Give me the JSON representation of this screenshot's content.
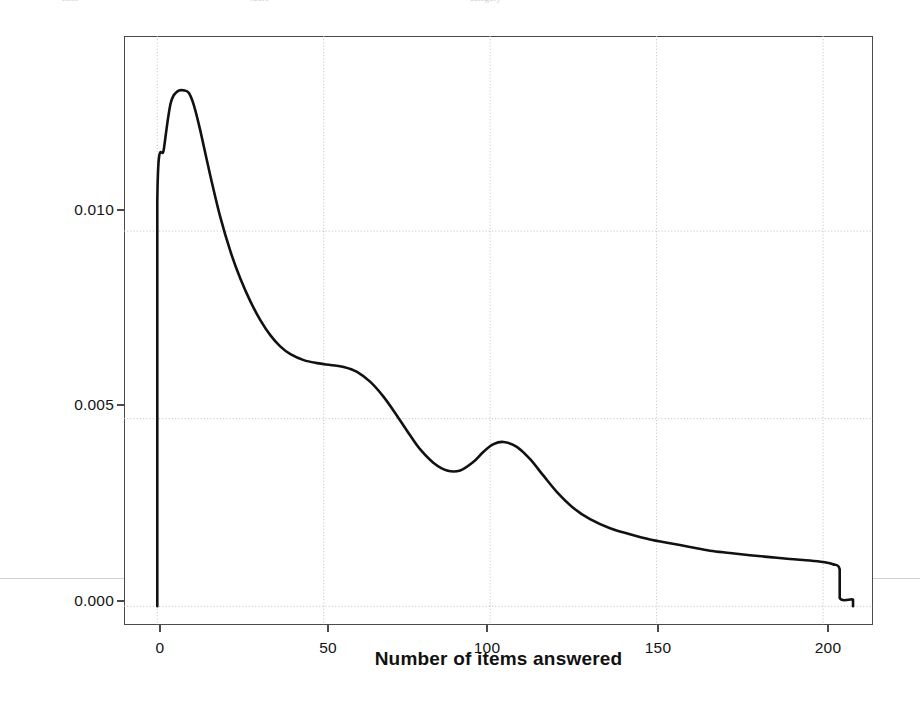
{
  "page": {
    "top_artifact_fragments": [
      "item",
      "score",
      "category"
    ],
    "background_color": "#ffffff"
  },
  "chart_data": {
    "type": "line",
    "title": "",
    "subtitle": "",
    "xlabel": "Number of items answered",
    "ylabel": "Probability Density",
    "xlim": [
      -10,
      215
    ],
    "ylim": [
      -0.0005,
      0.0152
    ],
    "xticks": [
      0,
      50,
      100,
      150,
      200
    ],
    "xticklabels": [
      "0",
      "50",
      "100",
      "150",
      "200"
    ],
    "yticks": [
      0.0,
      0.005,
      0.01
    ],
    "yticklabels": [
      "0.000",
      "0.005",
      "0.010"
    ],
    "grid": true,
    "grid_style": "dotted",
    "legend": "none",
    "line_color": "#111111",
    "line_width": 2.6,
    "series": [
      {
        "name": "Probability density of number of items answered",
        "x": [
          0,
          0,
          2,
          4,
          6,
          8,
          9.5,
          11,
          13,
          16,
          19,
          22,
          25,
          28,
          31,
          34,
          37,
          40,
          44,
          48,
          52,
          56,
          60,
          64,
          68,
          72,
          76,
          79,
          83,
          87,
          91,
          95,
          98,
          101,
          104,
          108,
          112,
          116,
          120,
          125,
          130,
          136,
          142,
          148,
          154,
          160,
          166,
          172,
          178,
          184,
          190,
          196,
          200,
          203,
          205,
          205,
          209,
          209
        ],
        "y": [
          0.0,
          0.0108,
          0.0122,
          0.0134,
          0.01372,
          0.01375,
          0.01368,
          0.01335,
          0.01265,
          0.01145,
          0.01035,
          0.00945,
          0.00872,
          0.00812,
          0.00762,
          0.00722,
          0.00692,
          0.00672,
          0.00656,
          0.00648,
          0.00643,
          0.00638,
          0.00625,
          0.00598,
          0.00558,
          0.00508,
          0.00455,
          0.00418,
          0.00382,
          0.00362,
          0.00362,
          0.00385,
          0.00412,
          0.00432,
          0.00438,
          0.00425,
          0.00392,
          0.00348,
          0.00305,
          0.00262,
          0.00232,
          0.00208,
          0.00192,
          0.00178,
          0.00168,
          0.00158,
          0.00148,
          0.00142,
          0.00136,
          0.00131,
          0.00126,
          0.00122,
          0.00118,
          0.00112,
          0.00098,
          0.00022,
          0.00018,
          0.0
        ]
      }
    ],
    "baseline_y": 0.0,
    "annotations": [
      {
        "name": "primary-mode",
        "x": 9,
        "y": 0.01375,
        "label": ""
      },
      {
        "name": "shoulder",
        "x": 52,
        "y": 0.00643,
        "label": ""
      },
      {
        "name": "local-minimum",
        "x": 86,
        "y": 0.00362,
        "label": ""
      },
      {
        "name": "secondary-mode",
        "x": 103,
        "y": 0.00438,
        "label": ""
      },
      {
        "name": "right-truncation",
        "x": 205,
        "y": 0.00098,
        "label": ""
      }
    ]
  }
}
